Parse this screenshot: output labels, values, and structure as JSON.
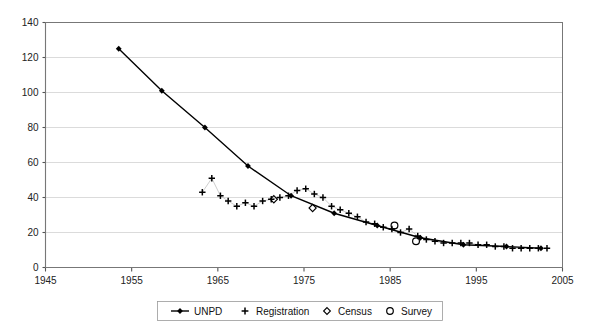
{
  "chart_data": {
    "type": "scatter",
    "title": "",
    "subtitle": "",
    "xlabel": "",
    "ylabel": "",
    "xlim": [
      1945,
      2005
    ],
    "ylim": [
      0,
      140
    ],
    "xticks": [
      1945,
      1955,
      1965,
      1975,
      1985,
      1995,
      2005
    ],
    "yticks": [
      0,
      20,
      40,
      60,
      80,
      100,
      120,
      140
    ],
    "grid": "horizontal",
    "legend_position": "bottom",
    "series": [
      {
        "name": "UNPD",
        "marker": "filled-diamond",
        "line": true,
        "points": [
          {
            "x": 1953.5,
            "y": 125
          },
          {
            "x": 1958.5,
            "y": 101
          },
          {
            "x": 1963.5,
            "y": 80
          },
          {
            "x": 1968.5,
            "y": 58
          },
          {
            "x": 1973.5,
            "y": 41
          },
          {
            "x": 1978.5,
            "y": 31
          },
          {
            "x": 1983.5,
            "y": 24
          },
          {
            "x": 1988.5,
            "y": 17
          },
          {
            "x": 1993.5,
            "y": 13
          },
          {
            "x": 1998.5,
            "y": 12
          },
          {
            "x": 2002.5,
            "y": 11
          }
        ]
      },
      {
        "name": "Registration",
        "marker": "plus",
        "line": false,
        "points": [
          {
            "x": 1963.2,
            "y": 43
          },
          {
            "x": 1964.3,
            "y": 51
          },
          {
            "x": 1965.3,
            "y": 41
          },
          {
            "x": 1966.2,
            "y": 38
          },
          {
            "x": 1967.2,
            "y": 35
          },
          {
            "x": 1968.2,
            "y": 37
          },
          {
            "x": 1969.2,
            "y": 35
          },
          {
            "x": 1970.2,
            "y": 38
          },
          {
            "x": 1971.2,
            "y": 39
          },
          {
            "x": 1972.2,
            "y": 40
          },
          {
            "x": 1973.2,
            "y": 41
          },
          {
            "x": 1974.2,
            "y": 44
          },
          {
            "x": 1975.2,
            "y": 45
          },
          {
            "x": 1976.2,
            "y": 42
          },
          {
            "x": 1977.2,
            "y": 40
          },
          {
            "x": 1978.2,
            "y": 35
          },
          {
            "x": 1979.2,
            "y": 33
          },
          {
            "x": 1980.2,
            "y": 31
          },
          {
            "x": 1981.2,
            "y": 29
          },
          {
            "x": 1982.2,
            "y": 26
          },
          {
            "x": 1983.2,
            "y": 25
          },
          {
            "x": 1984.2,
            "y": 23
          },
          {
            "x": 1985.2,
            "y": 22
          },
          {
            "x": 1986.2,
            "y": 20
          },
          {
            "x": 1987.2,
            "y": 22
          },
          {
            "x": 1988.2,
            "y": 18
          },
          {
            "x": 1989.2,
            "y": 16
          },
          {
            "x": 1990.2,
            "y": 15
          },
          {
            "x": 1991.2,
            "y": 14
          },
          {
            "x": 1992.2,
            "y": 14
          },
          {
            "x": 1993.2,
            "y": 14
          },
          {
            "x": 1994.2,
            "y": 14
          },
          {
            "x": 1995.2,
            "y": 13
          },
          {
            "x": 1996.2,
            "y": 13
          },
          {
            "x": 1997.2,
            "y": 12
          },
          {
            "x": 1998.2,
            "y": 12
          },
          {
            "x": 1999.2,
            "y": 11
          },
          {
            "x": 2000.2,
            "y": 11
          },
          {
            "x": 2001.2,
            "y": 11
          },
          {
            "x": 2002.2,
            "y": 11
          },
          {
            "x": 2003.2,
            "y": 11
          }
        ]
      },
      {
        "name": "Census",
        "marker": "open-diamond",
        "line": false,
        "points": [
          {
            "x": 1971.5,
            "y": 39
          },
          {
            "x": 1976.0,
            "y": 34
          }
        ]
      },
      {
        "name": "Survey",
        "marker": "open-circle",
        "line": false,
        "points": [
          {
            "x": 1985.5,
            "y": 24
          },
          {
            "x": 1988.0,
            "y": 15
          }
        ]
      }
    ]
  },
  "legend": {
    "items": [
      {
        "label": "UNPD",
        "marker": "line-with-filled-diamond"
      },
      {
        "label": "Registration",
        "marker": "plus"
      },
      {
        "label": "Census",
        "marker": "open-diamond"
      },
      {
        "label": "Survey",
        "marker": "open-circle"
      }
    ]
  },
  "axes": {
    "x_tick_labels": [
      "1945",
      "1955",
      "1965",
      "1975",
      "1985",
      "1995",
      "2005"
    ],
    "y_tick_labels": [
      "0",
      "20",
      "40",
      "60",
      "80",
      "100",
      "120",
      "140"
    ]
  },
  "colors": {
    "plot_line": "#000000",
    "gridline": "#cccccc",
    "frame": "#777777",
    "text": "#222222",
    "background": "#ffffff"
  }
}
